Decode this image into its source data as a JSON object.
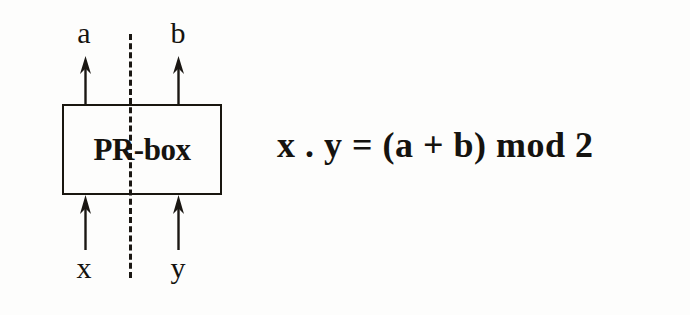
{
  "diagram": {
    "box": {
      "label": "PR-box",
      "name": "pr-box"
    },
    "separator": {
      "style": "dashed",
      "orientation": "vertical"
    },
    "outputs": [
      {
        "label": "a",
        "side": "left",
        "direction": "up"
      },
      {
        "label": "b",
        "side": "right",
        "direction": "up"
      }
    ],
    "inputs": [
      {
        "label": "x",
        "side": "left",
        "direction": "up"
      },
      {
        "label": "y",
        "side": "right",
        "direction": "up"
      }
    ],
    "equation": "x . y = (a + b) mod 2",
    "colors": {
      "ink": "#15130f",
      "background": "#fdfdfc"
    }
  }
}
